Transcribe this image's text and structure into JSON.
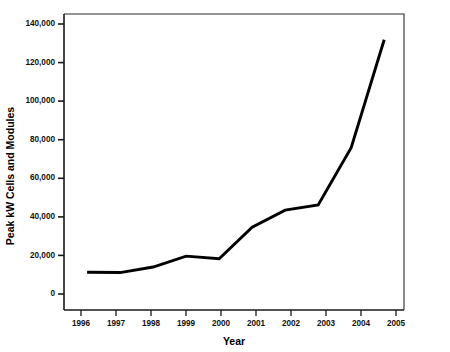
{
  "chart_data": {
    "type": "line",
    "title": "",
    "xlabel": "Year",
    "ylabel": "Peak kW Cells and Modules",
    "categories": [
      "1996",
      "1997",
      "1998",
      "1999",
      "2000",
      "2001",
      "2002",
      "2003",
      "2004",
      "2005"
    ],
    "x": [
      1996,
      1997,
      1998,
      1999,
      2000,
      2001,
      2002,
      2003,
      2004,
      2005
    ],
    "values": [
      12800,
      12600,
      15500,
      21200,
      19800,
      36300,
      45300,
      48000,
      78000,
      134500
    ],
    "series": [
      {
        "name": "Peak kW Cells and Modules",
        "values": [
          12800,
          12600,
          15500,
          21200,
          19800,
          36300,
          45300,
          48000,
          78000,
          134500
        ]
      }
    ],
    "xlim": [
      1995.3,
      2005.6
    ],
    "ylim": [
      -7000,
      148000
    ],
    "ytick_values": [
      0,
      20000,
      40000,
      60000,
      80000,
      100000,
      120000,
      140000
    ],
    "ytick_labels": [
      "0",
      "20,000",
      "40,000",
      "60,000",
      "80,000",
      "100,000",
      "120,000",
      "140,000"
    ],
    "xtick_labels": [
      "1996",
      "1997",
      "1998",
      "1999",
      "2000",
      "2001",
      "2002",
      "2003",
      "2004",
      "2005"
    ],
    "grid": false,
    "legend": false,
    "legend_position": "none",
    "line_color": "#000000",
    "background_color": "#ffffff",
    "axis_color": "#1a1a1a"
  }
}
